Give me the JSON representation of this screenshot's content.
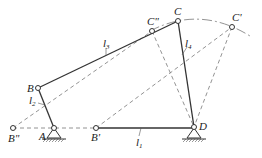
{
  "diagram": {
    "type": "four-bar linkage",
    "points": {
      "A": {
        "label": "A",
        "x": 54,
        "y": 128
      },
      "B": {
        "label": "B",
        "x": 38,
        "y": 88
      },
      "C": {
        "label": "C",
        "x": 178,
        "y": 21
      },
      "D": {
        "label": "D",
        "x": 194,
        "y": 127
      },
      "B_prime": {
        "label": "B'",
        "x": 96,
        "y": 128
      },
      "B_dprime": {
        "label": "B\"",
        "x": 13,
        "y": 128
      },
      "C_prime": {
        "label": "C'",
        "x": 232,
        "y": 27
      },
      "C_dprime": {
        "label": "C\"",
        "x": 152,
        "y": 31
      }
    },
    "links": {
      "l1": {
        "label": "l",
        "sub": "1"
      },
      "l2": {
        "label": "l",
        "sub": "2"
      },
      "l3": {
        "label": "l",
        "sub": "3"
      },
      "l4": {
        "label": "l",
        "sub": "4"
      }
    }
  }
}
